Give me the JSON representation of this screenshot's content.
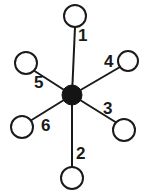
{
  "figure": {
    "background_color": "#ffffff",
    "stroke_color": "#1a1a1a",
    "hub_fill_color": "#141414",
    "node_fill_color": "#ffffff"
  },
  "hub": {
    "name": "center-node",
    "cx": 72,
    "cy": 95,
    "r": 10,
    "filled": true
  },
  "spokes": [
    {
      "id": "spoke-1",
      "label": "1",
      "direction": "up",
      "node": {
        "cx": 75,
        "cy": 16,
        "r": 11
      },
      "line": {
        "x1": 72,
        "y1": 95,
        "x2": 75,
        "y2": 27
      },
      "label_pos": {
        "x": 78,
        "y": 37
      }
    },
    {
      "id": "spoke-2",
      "label": "2",
      "direction": "down",
      "node": {
        "cx": 72,
        "cy": 178,
        "r": 11
      },
      "line": {
        "x1": 72,
        "y1": 95,
        "x2": 72,
        "y2": 167
      },
      "label_pos": {
        "x": 76,
        "y": 155
      }
    },
    {
      "id": "spoke-3",
      "label": "3",
      "direction": "lower-right",
      "node": {
        "cx": 124,
        "cy": 130,
        "r": 11
      },
      "line": {
        "x1": 72,
        "y1": 95,
        "x2": 117,
        "y2": 123
      },
      "label_pos": {
        "x": 103,
        "y": 110
      }
    },
    {
      "id": "spoke-4",
      "label": "4",
      "direction": "upper-right",
      "node": {
        "cx": 128,
        "cy": 61,
        "r": 10
      },
      "line": {
        "x1": 72,
        "y1": 95,
        "x2": 120,
        "y2": 67
      },
      "label_pos": {
        "x": 104,
        "y": 63
      }
    },
    {
      "id": "spoke-5",
      "label": "5",
      "direction": "upper-left",
      "node": {
        "cx": 26,
        "cy": 63,
        "r": 11
      },
      "line": {
        "x1": 72,
        "y1": 95,
        "x2": 33,
        "y2": 70
      },
      "label_pos": {
        "x": 34,
        "y": 84
      }
    },
    {
      "id": "spoke-6",
      "label": "6",
      "direction": "lower-left",
      "node": {
        "cx": 22,
        "cy": 127,
        "r": 11
      },
      "line": {
        "x1": 72,
        "y1": 95,
        "x2": 30,
        "y2": 121
      },
      "label_pos": {
        "x": 41,
        "y": 127
      }
    }
  ]
}
